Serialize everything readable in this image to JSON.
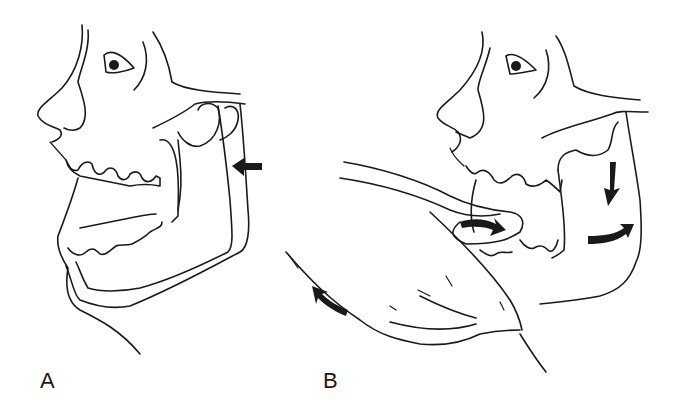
{
  "figure": {
    "panels": [
      {
        "id": "A",
        "label": "A",
        "description": "Side view of head with dislocated mandible displaced forward; arrow pointing backward at the jaw condyle"
      },
      {
        "id": "B",
        "label": "B",
        "description": "Reduction of dislocated jaw: thumb inside mouth on lower molars pressing down and back; curved arrows show direction of mandible movement"
      }
    ],
    "colors": {
      "line": "#1a1a1a",
      "background": "#ffffff"
    }
  }
}
